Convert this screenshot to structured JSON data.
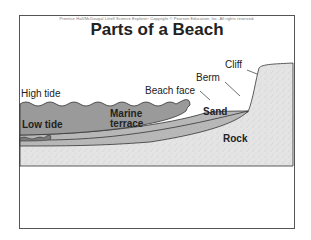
{
  "header": {
    "copyright": "Prentice Hall/McDougal Littell Science Explorer: Copyright © Pearson Education, Inc. All rights reserved.",
    "title": "Parts of a Beach"
  },
  "labels": {
    "high_tide": "High tide",
    "low_tide": "Low tide",
    "marine_terrace_line1": "Marine",
    "marine_terrace_line2": "terrace",
    "beach_face": "Beach face",
    "berm": "Berm",
    "cliff": "Cliff",
    "sand": "Sand",
    "rock": "Rock"
  },
  "colors": {
    "water": "#9a9a9a",
    "low_water": "#7a7a7a",
    "sand": "#b8b8b8",
    "rock": "#e4e4e4",
    "outline": "#333333",
    "frame": "#555555"
  }
}
